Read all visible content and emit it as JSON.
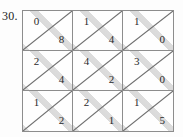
{
  "problem": {
    "number_label": "30."
  },
  "grid": {
    "rows": 3,
    "columns": 3,
    "border_color": "#8d8d8d",
    "diagonal_color": "#6f6f6f",
    "highlight_color": "#8b8b8b",
    "background_color": "#fefefe",
    "diagonal_direction": "bottom-left-to-top-right",
    "cells": [
      [
        {
          "upper": "0",
          "lower": "8"
        },
        {
          "upper": "1",
          "lower": "4"
        },
        {
          "upper": "1",
          "lower": "0"
        }
      ],
      [
        {
          "upper": "2",
          "lower": "4"
        },
        {
          "upper": "4",
          "lower": "2"
        },
        {
          "upper": "3",
          "lower": "0"
        }
      ],
      [
        {
          "upper": "1",
          "lower": "2"
        },
        {
          "upper": "2",
          "lower": "1"
        },
        {
          "upper": "1",
          "lower": "5"
        }
      ]
    ]
  }
}
